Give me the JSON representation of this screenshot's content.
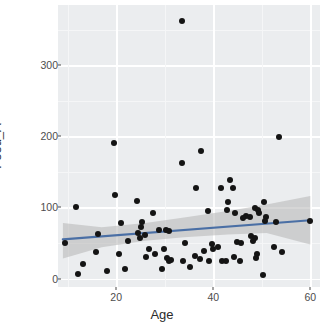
{
  "chart_data": {
    "type": "scatter",
    "title": "",
    "xlabel": "Age",
    "ylabel": "Food_A",
    "xlim": [
      8,
      62
    ],
    "ylim": [
      -12,
      385
    ],
    "xticks": [
      20,
      40,
      60
    ],
    "xtick_labels": [
      "20",
      "40",
      "60"
    ],
    "yticks": [
      0,
      100,
      200,
      300
    ],
    "ytick_labels": [
      "0",
      "100",
      "200",
      "300"
    ],
    "grid": true,
    "legend": "none",
    "point_color": "#141414",
    "panel_background": "#EBEDEF",
    "gridline_color": "#FFFFFF",
    "trend": {
      "type": "linear-fit",
      "line_color": "#4A6FA5",
      "band_color": "#B5B5B5",
      "band_opacity": 0.55,
      "x_start": 9,
      "y_start": 55,
      "x_end": 60,
      "y_end": 82,
      "band_upper": [
        78,
        72,
        78,
        86,
        95,
        104,
        116
      ],
      "band_lower": [
        28,
        44,
        53,
        58,
        62,
        64,
        48
      ],
      "band_x": [
        9,
        17,
        26,
        34,
        43,
        51,
        60
      ]
    },
    "points": [
      {
        "x": 33.5,
        "y": 363
      },
      {
        "x": 53.5,
        "y": 199
      },
      {
        "x": 19.5,
        "y": 191
      },
      {
        "x": 37.5,
        "y": 180
      },
      {
        "x": 33.5,
        "y": 162
      },
      {
        "x": 43.5,
        "y": 139
      },
      {
        "x": 44.0,
        "y": 128
      },
      {
        "x": 41.5,
        "y": 127
      },
      {
        "x": 36.5,
        "y": 128
      },
      {
        "x": 19.8,
        "y": 118
      },
      {
        "x": 50.5,
        "y": 108
      },
      {
        "x": 24.2,
        "y": 109
      },
      {
        "x": 43.0,
        "y": 108
      },
      {
        "x": 11.8,
        "y": 100
      },
      {
        "x": 48.5,
        "y": 99
      },
      {
        "x": 49.2,
        "y": 96
      },
      {
        "x": 42.8,
        "y": 97
      },
      {
        "x": 39.0,
        "y": 95
      },
      {
        "x": 49.5,
        "y": 92
      },
      {
        "x": 27.5,
        "y": 92
      },
      {
        "x": 44.5,
        "y": 92
      },
      {
        "x": 46.8,
        "y": 88
      },
      {
        "x": 47.5,
        "y": 86
      },
      {
        "x": 46.2,
        "y": 85
      },
      {
        "x": 50.8,
        "y": 86
      },
      {
        "x": 50.6,
        "y": 81
      },
      {
        "x": 53.0,
        "y": 80
      },
      {
        "x": 60.0,
        "y": 81
      },
      {
        "x": 25.2,
        "y": 80
      },
      {
        "x": 21.0,
        "y": 78
      },
      {
        "x": 25.0,
        "y": 72
      },
      {
        "x": 30.2,
        "y": 69
      },
      {
        "x": 28.8,
        "y": 68
      },
      {
        "x": 30.8,
        "y": 67
      },
      {
        "x": 24.5,
        "y": 64
      },
      {
        "x": 16.2,
        "y": 63
      },
      {
        "x": 26.0,
        "y": 61
      },
      {
        "x": 24.8,
        "y": 57
      },
      {
        "x": 47.8,
        "y": 60
      },
      {
        "x": 48.6,
        "y": 57
      },
      {
        "x": 48.2,
        "y": 53
      },
      {
        "x": 44.8,
        "y": 52
      },
      {
        "x": 45.8,
        "y": 50
      },
      {
        "x": 22.5,
        "y": 53
      },
      {
        "x": 34.2,
        "y": 50
      },
      {
        "x": 9.5,
        "y": 50
      },
      {
        "x": 39.8,
        "y": 48
      },
      {
        "x": 41.0,
        "y": 44
      },
      {
        "x": 40.0,
        "y": 42
      },
      {
        "x": 52.5,
        "y": 44
      },
      {
        "x": 54.2,
        "y": 37
      },
      {
        "x": 38.0,
        "y": 39
      },
      {
        "x": 29.8,
        "y": 41
      },
      {
        "x": 26.8,
        "y": 41
      },
      {
        "x": 28.0,
        "y": 34
      },
      {
        "x": 26.2,
        "y": 31
      },
      {
        "x": 15.8,
        "y": 38
      },
      {
        "x": 20.5,
        "y": 35
      },
      {
        "x": 49.0,
        "y": 35
      },
      {
        "x": 48.8,
        "y": 29
      },
      {
        "x": 44.2,
        "y": 30
      },
      {
        "x": 36.2,
        "y": 32
      },
      {
        "x": 37.2,
        "y": 27
      },
      {
        "x": 31.2,
        "y": 26
      },
      {
        "x": 30.8,
        "y": 24
      },
      {
        "x": 30.5,
        "y": 29
      },
      {
        "x": 39.2,
        "y": 25
      },
      {
        "x": 41.8,
        "y": 25
      },
      {
        "x": 42.6,
        "y": 25
      },
      {
        "x": 45.5,
        "y": 25
      },
      {
        "x": 33.8,
        "y": 24
      },
      {
        "x": 35.2,
        "y": 16
      },
      {
        "x": 29.5,
        "y": 14
      },
      {
        "x": 13.2,
        "y": 21
      },
      {
        "x": 18.0,
        "y": 11
      },
      {
        "x": 21.8,
        "y": 13
      },
      {
        "x": 12.2,
        "y": 7
      },
      {
        "x": 50.2,
        "y": 5
      }
    ]
  }
}
